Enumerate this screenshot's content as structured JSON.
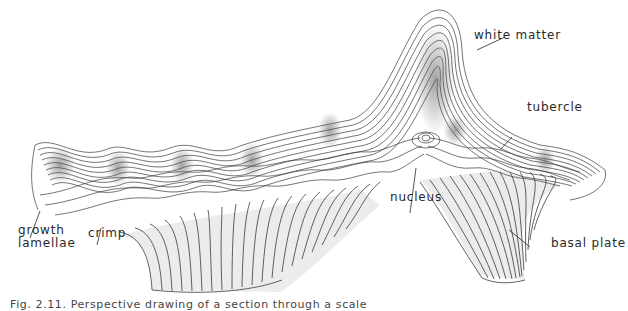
{
  "figure": {
    "labels": {
      "white_matter": "white matter",
      "tubercle": "tubercle",
      "growth": "growth",
      "lamellae": "lamellae",
      "crimp": "crimp",
      "nucleus": "nucleus",
      "basal_plate": "basal plate"
    },
    "caption": "Fig. 2.11. Perspective drawing of a section through a scale"
  },
  "colors": {
    "line": "#3a3a3a",
    "shade": "#e6e6e6",
    "dark_shade": "#8a8a8a",
    "label": "#2a2a2a"
  }
}
